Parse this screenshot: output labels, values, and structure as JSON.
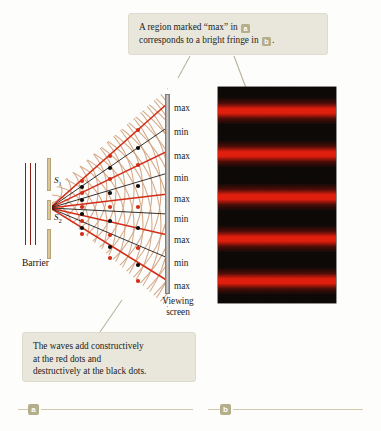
{
  "callouts": {
    "top": {
      "line1_pre": "A region marked “max” in",
      "line1_badge": "a",
      "line2_pre": "corresponds to a bright fringe in",
      "line2_badge": "b",
      "line2_post": "."
    },
    "bottom": {
      "line1": "The waves add constructively",
      "line2": "at the red dots and",
      "line3": "destructively at the black dots."
    }
  },
  "diagram": {
    "barrier_label": "Barrier",
    "slit1_label": "S",
    "slit1_sub": "1",
    "slit2_label": "S",
    "slit2_sub": "2",
    "viewing_screen_label_line1": "Viewing",
    "viewing_screen_label_line2": "screen",
    "fringe_labels": [
      {
        "text": "max",
        "y": 103
      },
      {
        "text": "min",
        "y": 127
      },
      {
        "text": "max",
        "y": 151
      },
      {
        "text": "min",
        "y": 173
      },
      {
        "text": "max",
        "y": 194
      },
      {
        "text": "min",
        "y": 214
      },
      {
        "text": "max",
        "y": 235
      },
      {
        "text": "min",
        "y": 258
      },
      {
        "text": "max",
        "y": 281
      }
    ]
  },
  "fringe_photo": {
    "background_color": "#0b0705",
    "fringe_color": "#e01d0c",
    "bright_fringes": [
      {
        "center": 24,
        "thickness": 15
      },
      {
        "center": 67,
        "thickness": 15
      },
      {
        "center": 110,
        "thickness": 15
      },
      {
        "center": 152,
        "thickness": 15
      },
      {
        "center": 194,
        "thickness": 15
      }
    ]
  },
  "panels": {
    "a_badge": "a",
    "b_badge": "b"
  },
  "colors": {
    "callout_bg": "#e9e7da",
    "badge_bg": "#b4ae8a",
    "constructive_red": "#d22b16",
    "destructive_black": "#0d0d0d",
    "wave_tan": "#d2a583",
    "barrier_tan": "#d9c79a",
    "source_dark_red": "#8e1d14",
    "screen_gray": "#b0b0b0"
  }
}
